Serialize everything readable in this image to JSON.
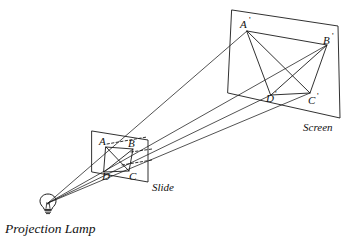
{
  "figure": {
    "background_color": "#ffffff",
    "ink_color": "#1a1a1a",
    "width": 351,
    "height": 239
  },
  "captions": {
    "lamp": "Projection Lamp",
    "slide": "Slide",
    "screen": "Screen"
  },
  "slide_points": {
    "a": "A",
    "b": "B",
    "c": "C",
    "d": "D"
  },
  "screen_points": {
    "a": "A",
    "a_prime": "'",
    "b": "B",
    "b_prime": "'",
    "c": "C",
    "c_prime": "'",
    "d": "D",
    "d_prime": "'"
  },
  "geometry": {
    "lamp_position": [
      48,
      203
    ],
    "slide_frame": [
      [
        92,
        131
      ],
      [
        148,
        140
      ],
      [
        148,
        182
      ],
      [
        92,
        172
      ]
    ],
    "screen_frame": [
      [
        232,
        10
      ],
      [
        338,
        26
      ],
      [
        340,
        118
      ],
      [
        228,
        93
      ]
    ],
    "slide_quad": [
      [
        106,
        147
      ],
      [
        133,
        149
      ],
      [
        129,
        171
      ],
      [
        104,
        172
      ]
    ],
    "screen_quad": [
      [
        247,
        31
      ],
      [
        327,
        45
      ],
      [
        310,
        93
      ],
      [
        271,
        95
      ]
    ],
    "rays": [
      {
        "name": "ray-to-A",
        "from": [
          48,
          203
        ],
        "to": [
          247,
          31
        ],
        "via": [
          106,
          147
        ]
      },
      {
        "name": "ray-to-B",
        "from": [
          48,
          203
        ],
        "to": [
          327,
          45
        ],
        "via": [
          133,
          149
        ]
      },
      {
        "name": "ray-to-C",
        "from": [
          48,
          203
        ],
        "to": [
          310,
          93
        ],
        "via": [
          129,
          171
        ]
      },
      {
        "name": "ray-to-D",
        "from": [
          48,
          203
        ],
        "to": [
          271,
          95
        ],
        "via": [
          104,
          172
        ]
      }
    ]
  }
}
